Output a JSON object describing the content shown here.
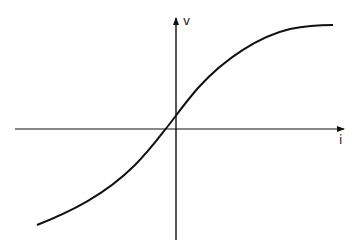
{
  "diagram": {
    "type": "characteristic-curve",
    "colors": {
      "background": "#ffffff",
      "stroke": "#111111"
    },
    "axes": {
      "horizontal": {
        "label": "i",
        "from": [
          15,
          129
        ],
        "to": [
          344,
          129
        ],
        "arrow": true
      },
      "vertical": {
        "label": "v",
        "from": [
          176,
          240
        ],
        "to": [
          176,
          17
        ],
        "arrow": true
      },
      "origin": [
        176,
        129
      ]
    },
    "labels": {
      "v_axis": "v",
      "i_axis": "i"
    },
    "curve": {
      "shape": "sigmoid",
      "start": [
        37,
        225
      ],
      "x_intercept": [
        165,
        129
      ],
      "y_intercept": [
        176,
        116
      ],
      "end": [
        333,
        25
      ]
    }
  }
}
